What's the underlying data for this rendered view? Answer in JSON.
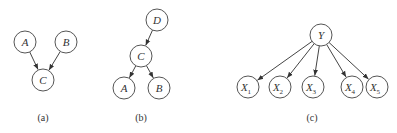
{
  "colors": {
    "node_stroke": "#555555",
    "edge": "#444444",
    "text": "#333333",
    "background": "#ffffff"
  },
  "diagrams": [
    {
      "caption": "(a)",
      "nodes": [
        {
          "id": "A",
          "label": "A",
          "x": 25,
          "y": 42
        },
        {
          "id": "B",
          "label": "B",
          "x": 66,
          "y": 42
        },
        {
          "id": "C",
          "label": "C",
          "x": 43,
          "y": 80
        }
      ],
      "edges": [
        {
          "from": "A",
          "to": "C"
        },
        {
          "from": "B",
          "to": "C"
        }
      ],
      "caption_pos": {
        "x": 43,
        "y": 121
      }
    },
    {
      "caption": "(b)",
      "nodes": [
        {
          "id": "D",
          "label": "D",
          "x": 157,
          "y": 20
        },
        {
          "id": "C",
          "label": "C",
          "x": 141,
          "y": 56
        },
        {
          "id": "A",
          "label": "A",
          "x": 124,
          "y": 88
        },
        {
          "id": "B",
          "label": "B",
          "x": 159,
          "y": 88
        }
      ],
      "edges": [
        {
          "from": "D",
          "to": "C"
        },
        {
          "from": "C",
          "to": "A"
        },
        {
          "from": "C",
          "to": "B"
        }
      ],
      "caption_pos": {
        "x": 141,
        "y": 121
      }
    },
    {
      "caption": "(c)",
      "nodes": [
        {
          "id": "Y",
          "label": "Y",
          "sub": "",
          "x": 321,
          "y": 35
        },
        {
          "id": "X1",
          "label": "X",
          "sub": "1",
          "x": 248,
          "y": 87
        },
        {
          "id": "X2",
          "label": "X",
          "sub": "2",
          "x": 280,
          "y": 87
        },
        {
          "id": "X3",
          "label": "X",
          "sub": "3",
          "x": 313,
          "y": 87
        },
        {
          "id": "X4",
          "label": "X",
          "sub": "4",
          "x": 352,
          "y": 87
        },
        {
          "id": "X5",
          "label": "X",
          "sub": "5",
          "x": 377,
          "y": 87
        }
      ],
      "edges": [
        {
          "from": "Y",
          "to": "X1"
        },
        {
          "from": "Y",
          "to": "X2"
        },
        {
          "from": "Y",
          "to": "X3"
        },
        {
          "from": "Y",
          "to": "X4"
        },
        {
          "from": "Y",
          "to": "X5"
        }
      ],
      "caption_pos": {
        "x": 312,
        "y": 121
      }
    }
  ],
  "node_radius": 11
}
